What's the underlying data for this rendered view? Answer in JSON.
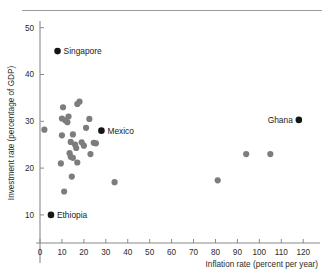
{
  "chart_data": {
    "type": "scatter",
    "title": "",
    "xlabel": "Inflation rate (percent per year)",
    "ylabel": "Investment rate (percentage of GDP)",
    "xlim": [
      0,
      124
    ],
    "ylim": [
      4,
      51
    ],
    "xticks": [
      0,
      10,
      20,
      30,
      40,
      50,
      60,
      70,
      80,
      90,
      100,
      110,
      120
    ],
    "yticks": [
      10,
      20,
      30,
      40,
      50
    ],
    "grid": false,
    "legend": null,
    "marker_colors": {
      "unlabeled": "#7d7d7d",
      "labeled": "#151515"
    },
    "points": [
      {
        "x": 2,
        "y": 28.2,
        "label": "",
        "highlight": false
      },
      {
        "x": 8,
        "y": 45,
        "label": "Singapore",
        "highlight": true,
        "label_side": "right"
      },
      {
        "x": 5,
        "y": 10,
        "label": "Ethiopia",
        "highlight": true,
        "label_side": "right"
      },
      {
        "x": 28,
        "y": 28,
        "label": "Mexico",
        "highlight": true,
        "label_side": "right"
      },
      {
        "x": 118,
        "y": 30.3,
        "label": "Ghana",
        "highlight": true,
        "label_side": "left"
      },
      {
        "x": 10.5,
        "y": 33,
        "label": "",
        "highlight": false
      },
      {
        "x": 17,
        "y": 33.7,
        "label": "",
        "highlight": false
      },
      {
        "x": 18,
        "y": 34.2,
        "label": "",
        "highlight": false
      },
      {
        "x": 10,
        "y": 30.6,
        "label": "",
        "highlight": false
      },
      {
        "x": 11.5,
        "y": 30.2,
        "label": "",
        "highlight": false
      },
      {
        "x": 12.5,
        "y": 29.8,
        "label": "",
        "highlight": false
      },
      {
        "x": 13,
        "y": 31,
        "label": "",
        "highlight": false
      },
      {
        "x": 22.5,
        "y": 30.5,
        "label": "",
        "highlight": false
      },
      {
        "x": 10,
        "y": 27,
        "label": "",
        "highlight": false
      },
      {
        "x": 15,
        "y": 27.2,
        "label": "",
        "highlight": false
      },
      {
        "x": 21,
        "y": 28.6,
        "label": "",
        "highlight": false
      },
      {
        "x": 14,
        "y": 25.6,
        "label": "",
        "highlight": false
      },
      {
        "x": 16,
        "y": 25,
        "label": "",
        "highlight": false
      },
      {
        "x": 16.5,
        "y": 24.3,
        "label": "",
        "highlight": false
      },
      {
        "x": 19,
        "y": 25.5,
        "label": "",
        "highlight": false
      },
      {
        "x": 20,
        "y": 24.8,
        "label": "",
        "highlight": false
      },
      {
        "x": 24.5,
        "y": 25.4,
        "label": "",
        "highlight": false
      },
      {
        "x": 25.5,
        "y": 25.3,
        "label": "",
        "highlight": false
      },
      {
        "x": 13.5,
        "y": 23.2,
        "label": "",
        "highlight": false
      },
      {
        "x": 14,
        "y": 22.4,
        "label": "",
        "highlight": false
      },
      {
        "x": 15,
        "y": 22.2,
        "label": "",
        "highlight": false
      },
      {
        "x": 23,
        "y": 23,
        "label": "",
        "highlight": false
      },
      {
        "x": 9.5,
        "y": 21,
        "label": "",
        "highlight": false
      },
      {
        "x": 17,
        "y": 21.2,
        "label": "",
        "highlight": false
      },
      {
        "x": 14.5,
        "y": 18.2,
        "label": "",
        "highlight": false
      },
      {
        "x": 11,
        "y": 15,
        "label": "",
        "highlight": false
      },
      {
        "x": 34,
        "y": 17,
        "label": "",
        "highlight": false
      },
      {
        "x": 81,
        "y": 17.4,
        "label": "",
        "highlight": false
      },
      {
        "x": 94,
        "y": 23,
        "label": "",
        "highlight": false
      },
      {
        "x": 105,
        "y": 23,
        "label": "",
        "highlight": false
      }
    ]
  }
}
